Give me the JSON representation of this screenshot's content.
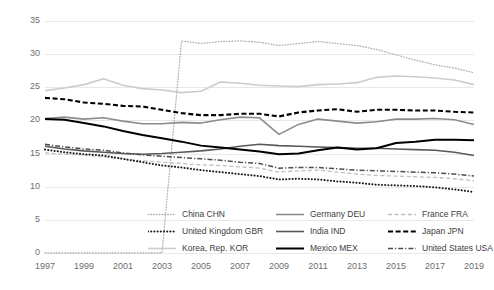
{
  "chart_data": {
    "type": "line",
    "title": "",
    "subtitle": "",
    "xlabel": "",
    "ylabel": "",
    "xlim": [
      1997,
      2019
    ],
    "ylim": [
      0,
      35
    ],
    "ytick_values": [
      0,
      5,
      10,
      15,
      20,
      25,
      30,
      35
    ],
    "ytick_labels": [
      "0",
      "5",
      "10",
      "15",
      "20",
      "25",
      "30",
      "35"
    ],
    "xtick_values": [
      1997,
      1999,
      2001,
      2003,
      2005,
      2007,
      2009,
      2011,
      2013,
      2015,
      2017,
      2019
    ],
    "xtick_labels": [
      "1997",
      "1999",
      "2001",
      "2003",
      "2005",
      "2007",
      "2009",
      "2011",
      "2013",
      "2015",
      "2017",
      "2019"
    ],
    "x": [
      1997,
      1998,
      1999,
      2000,
      2001,
      2002,
      2003,
      2004,
      2005,
      2006,
      2007,
      2008,
      2009,
      2010,
      2011,
      2012,
      2013,
      2014,
      2015,
      2016,
      2017,
      2018,
      2019
    ],
    "grid": "horizontal",
    "legend_position": "bottom",
    "legend_columns": 3,
    "series": [
      {
        "name": "China CHN",
        "style": "dotted",
        "color": "#b3b3b3",
        "width": 1.3,
        "values": [
          0,
          0,
          0,
          0,
          0,
          0,
          0,
          32.0,
          31.6,
          31.9,
          32.0,
          31.8,
          31.3,
          31.6,
          31.9,
          31.6,
          31.3,
          30.7,
          29.9,
          29.1,
          28.4,
          27.9,
          27.2
        ]
      },
      {
        "name": "Germany DEU",
        "style": "solid",
        "color": "#8c8c8c",
        "width": 1.6,
        "values": [
          20.3,
          20.5,
          20.2,
          20.4,
          19.9,
          19.5,
          19.5,
          19.7,
          19.6,
          20.1,
          20.5,
          20.4,
          17.9,
          19.4,
          20.2,
          19.9,
          19.6,
          19.8,
          20.2,
          20.2,
          20.3,
          20.1,
          19.4
        ]
      },
      {
        "name": "France FRA",
        "style": "dashed",
        "color": "#bfbfbf",
        "width": 1.3,
        "values": [
          15.1,
          14.9,
          14.8,
          14.5,
          14.2,
          13.9,
          13.7,
          13.5,
          13.3,
          13.2,
          13.0,
          12.8,
          12.2,
          12.4,
          12.5,
          12.2,
          11.9,
          11.7,
          11.6,
          11.5,
          11.4,
          11.2,
          10.9
        ]
      },
      {
        "name": "United Kingdom GBR",
        "style": "dotted-thick",
        "color": "#1a1a1a",
        "width": 2.0,
        "values": [
          15.6,
          15.2,
          14.9,
          14.7,
          14.2,
          13.7,
          13.2,
          12.9,
          12.5,
          12.2,
          11.9,
          11.6,
          11.1,
          11.2,
          11.1,
          10.8,
          10.6,
          10.3,
          10.2,
          10.1,
          9.9,
          9.6,
          9.2
        ]
      },
      {
        "name": "India IND",
        "style": "solid",
        "color": "#595959",
        "width": 1.6,
        "values": [
          16.1,
          15.7,
          15.4,
          15.2,
          15.0,
          14.9,
          15.0,
          15.2,
          15.4,
          15.7,
          16.1,
          16.4,
          16.2,
          16.1,
          16.0,
          15.9,
          15.8,
          15.8,
          15.7,
          15.6,
          15.5,
          15.2,
          14.7
        ]
      },
      {
        "name": "Japan JPN",
        "style": "dashed-thick",
        "color": "#000000",
        "width": 2.1,
        "values": [
          23.4,
          23.2,
          22.7,
          22.5,
          22.2,
          22.1,
          21.6,
          21.1,
          20.8,
          20.8,
          21.0,
          21.0,
          20.6,
          21.2,
          21.5,
          21.7,
          21.3,
          21.6,
          21.6,
          21.5,
          21.5,
          21.3,
          21.2
        ]
      },
      {
        "name": "Korea, Rep. KOR",
        "style": "solid",
        "color": "#cccccc",
        "width": 1.6,
        "values": [
          24.5,
          24.9,
          25.4,
          26.3,
          25.3,
          24.8,
          24.6,
          24.2,
          24.4,
          25.8,
          25.6,
          25.3,
          25.2,
          25.1,
          25.4,
          25.5,
          25.7,
          26.5,
          26.7,
          26.6,
          26.4,
          26.1,
          25.4
        ]
      },
      {
        "name": "Mexico MEX",
        "style": "solid",
        "color": "#000000",
        "width": 2.0,
        "values": [
          20.2,
          20.1,
          19.6,
          19.1,
          18.4,
          17.8,
          17.3,
          16.8,
          16.2,
          15.9,
          15.6,
          15.3,
          14.9,
          15.0,
          15.5,
          15.9,
          15.6,
          15.8,
          16.6,
          16.8,
          17.1,
          17.1,
          17.0
        ]
      },
      {
        "name": "United States USA",
        "style": "dash-dot",
        "color": "#4d4d4d",
        "width": 1.5,
        "values": [
          16.4,
          16.0,
          15.7,
          15.5,
          15.1,
          14.8,
          14.6,
          14.4,
          14.2,
          14.0,
          13.7,
          13.5,
          12.8,
          12.9,
          12.9,
          12.7,
          12.5,
          12.4,
          12.3,
          12.2,
          12.1,
          11.9,
          11.6
        ]
      }
    ]
  },
  "legend": {
    "rows": [
      [
        {
          "label": "China CHN",
          "style": "dotted",
          "color": "#b3b3b3"
        },
        {
          "label": "Germany DEU",
          "style": "solid",
          "color": "#8c8c8c"
        },
        {
          "label": "France FRA",
          "style": "dashed",
          "color": "#bfbfbf"
        }
      ],
      [
        {
          "label": "United Kingdom GBR",
          "style": "dotted-thick",
          "color": "#1a1a1a"
        },
        {
          "label": "India IND",
          "style": "solid",
          "color": "#595959"
        },
        {
          "label": "Japan JPN",
          "style": "dashed-thick",
          "color": "#000000"
        }
      ],
      [
        {
          "label": "Korea, Rep. KOR",
          "style": "solid",
          "color": "#cccccc"
        },
        {
          "label": "Mexico MEX",
          "style": "solid",
          "color": "#000000"
        },
        {
          "label": "United States USA",
          "style": "dash-dot",
          "color": "#4d4d4d"
        }
      ]
    ]
  },
  "colors": {
    "gridline": "#e8e8e8",
    "tick_text": "#6d6d6d",
    "legend_text": "#404040",
    "background": "#ffffff"
  }
}
